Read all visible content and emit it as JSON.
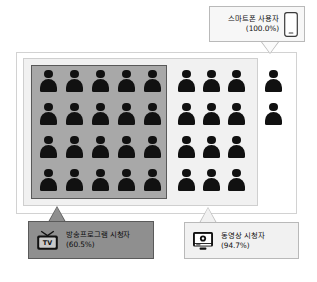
{
  "diagram": {
    "type": "nested-containment-pictogram",
    "total_people_icons": 34,
    "groups": {
      "smartphone": {
        "label": "스마트폰 사용자",
        "percent": "(100.0%)",
        "icon": "smartphone-icon",
        "people_outside_inner_boxes": 2,
        "box_fill": "#ffffff"
      },
      "video": {
        "label": "동영상 시청자",
        "percent": "(94.7%)",
        "icon": "video-monitor-icon",
        "people_in_band": 12,
        "box_fill": "#f1f1f1"
      },
      "tv": {
        "label": "방송프로그램 시청자",
        "percent": "(60.5%)",
        "icon": "tv-icon",
        "icon_text": "TV",
        "people_in_box": 20,
        "grid_columns": 5,
        "grid_rows": 4,
        "box_fill": "#a8a8a8"
      }
    },
    "colors": {
      "person": "#111111",
      "tv_box": "#a8a8a8",
      "tv_box_border": "#595959",
      "video_box": "#f1f1f1",
      "video_box_border": "#cfcfcf",
      "smartphone_box": "#ffffff",
      "smartphone_box_border": "#d2d2d2",
      "tv_callout_bg": "#8f8f8f",
      "video_callout_bg": "#f1f1f1",
      "smartphone_callout_bg": "#f7f7f7"
    }
  }
}
